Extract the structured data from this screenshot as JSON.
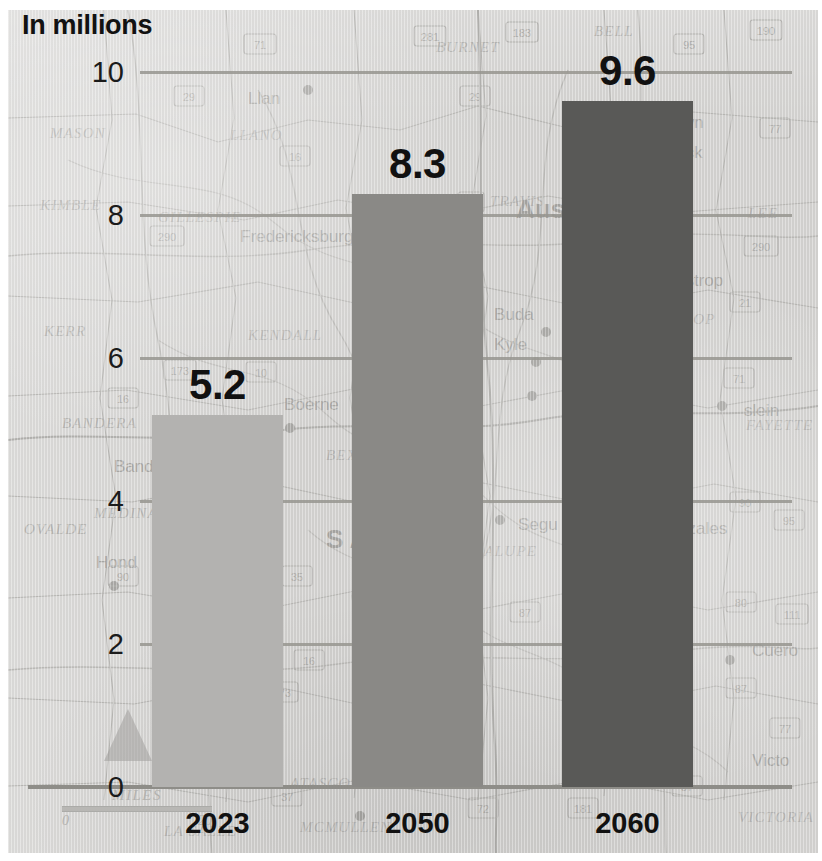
{
  "chart_data": {
    "type": "bar",
    "title": "In millions",
    "subtitle": "",
    "xlabel": "",
    "ylabel": "In millions",
    "categories": [
      "2023",
      "2050",
      "2060"
    ],
    "values": [
      5.2,
      8.3,
      9.6
    ],
    "value_labels": [
      "5.2",
      "8.3",
      "9.6"
    ],
    "series": [
      {
        "name": "Population",
        "values": [
          5.2,
          8.3,
          9.6
        ]
      }
    ],
    "ylim": [
      0,
      10
    ],
    "yticks": [
      0,
      2,
      4,
      6,
      8,
      10
    ],
    "ytick_labels": [
      "0",
      "2",
      "4",
      "6",
      "8",
      "10"
    ],
    "grid": true,
    "grid_axis": "y",
    "legend": false,
    "legend_position": "none",
    "bar_colors": [
      "#b3b2b0",
      "#8a8986",
      "#595957"
    ],
    "background": "map of central Texas",
    "units": "millions of people"
  },
  "title": {
    "text": "In millions"
  },
  "axis": {
    "y_ticks": [
      {
        "label": "10",
        "value": 10
      },
      {
        "label": "8",
        "value": 8
      },
      {
        "label": "6",
        "value": 6
      },
      {
        "label": "4",
        "value": 4
      },
      {
        "label": "2",
        "value": 2
      },
      {
        "label": "0",
        "value": 0
      }
    ],
    "x_labels": [
      "2023",
      "2050",
      "2060"
    ]
  },
  "bars": [
    {
      "label": "2023",
      "value": 5.2,
      "value_label": "5.2",
      "color": "#b3b2b0"
    },
    {
      "label": "2050",
      "value": 8.3,
      "value_label": "8.3",
      "color": "#8a8986"
    },
    {
      "label": "2060",
      "value": 9.6,
      "value_label": "9.6",
      "color": "#595957"
    }
  ],
  "map": {
    "scale_title": "MILES",
    "scale_start": "0",
    "scale_end": "20",
    "counties": [
      "MASON",
      "LLANO",
      "BURNET",
      "BELL",
      "KIMBLE",
      "GILLESPIE",
      "KERR",
      "KENDALL",
      "TRAVIS",
      "LEE",
      "BANDERA",
      "BEXAR",
      "MEDINA",
      "OVALDE",
      "GUADALUPE",
      "FAYETTE",
      "LA SALLE",
      "MCMULLEN",
      "ATASCOSA",
      "VICTORIA",
      "MCMULLEN",
      "BASTROP"
    ],
    "cities": [
      "Austin",
      "San Antonio",
      "Fredericksburg",
      "Boerne",
      "Bandera",
      "Hondo",
      "Buda",
      "Kyle",
      "San Marcos",
      "Seguin",
      "Bastrop",
      "Georgetown",
      "Round Rock",
      "New Braunfels",
      "Cuero",
      "Gonzales",
      "Karnes City",
      "Victoria",
      "Llano",
      "Lockhart"
    ],
    "highway_shields": [
      "281",
      "183",
      "95",
      "190",
      "71",
      "29",
      "16",
      "290",
      "87",
      "10",
      "37",
      "173",
      "35",
      "90",
      "21",
      "80",
      "72",
      "181",
      "77",
      "183",
      "97"
    ]
  }
}
